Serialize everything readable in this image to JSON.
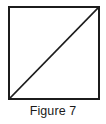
{
  "figure": {
    "caption": "Figure 7",
    "diagram": {
      "type": "geometry-square-with-diagonal",
      "shape_label": "square",
      "stroke_color": "#1c1c1c",
      "fill_color": "#ffffff",
      "border_width_px": 2,
      "diagonal_width_px": 1.6,
      "square": {
        "left_px": 8,
        "top_px": 6,
        "width_px": 92,
        "height_px": 94
      },
      "diagonal": {
        "from": "bottom-left",
        "to": "top-right",
        "x1_px": 9,
        "y1_px": 99,
        "x2_px": 99,
        "y2_px": 7
      }
    }
  }
}
